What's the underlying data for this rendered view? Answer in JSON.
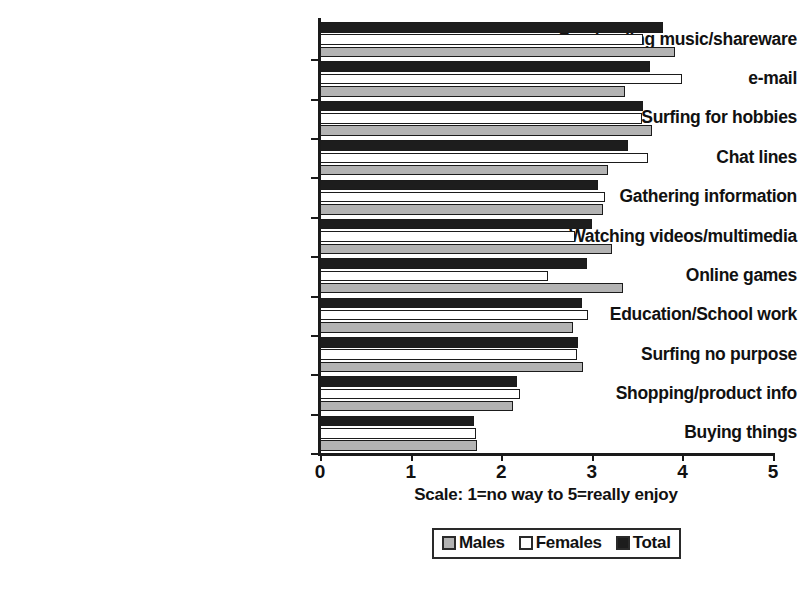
{
  "chart_data": {
    "type": "bar",
    "orientation": "horizontal",
    "title": "",
    "xlabel": "Scale:  1=no way to 5=really enjoy",
    "ylabel": "",
    "xlim": [
      0,
      5
    ],
    "xticks": [
      "0",
      "1",
      "2",
      "3",
      "4",
      "5"
    ],
    "grid": false,
    "legend_position": "bottom-center",
    "categories": [
      "Dowloading music/shareware",
      "e-mail",
      "Surfing for hobbies",
      "Chat lines",
      "Gathering information",
      "Watching videos/multimedia",
      "Online games",
      "Education/School work",
      "Surfing no purpose",
      "Shopping/product info",
      "Buying things"
    ],
    "series": [
      {
        "name": "Total",
        "color": "#1d1d1d",
        "values": [
          3.79,
          3.64,
          3.57,
          3.4,
          3.07,
          3.0,
          2.95,
          2.89,
          2.85,
          2.17,
          1.7
        ]
      },
      {
        "name": "Females",
        "color": "#ffffff",
        "values": [
          3.57,
          4.0,
          3.55,
          3.62,
          3.15,
          2.81,
          2.52,
          2.96,
          2.84,
          2.21,
          1.72
        ]
      },
      {
        "name": "Males",
        "color": "#b3b3b3",
        "values": [
          3.92,
          3.37,
          3.66,
          3.18,
          3.12,
          3.22,
          3.34,
          2.79,
          2.9,
          2.13,
          1.73
        ]
      }
    ],
    "legend": [
      {
        "label": "Males",
        "swatch": "males"
      },
      {
        "label": "Females",
        "swatch": "females"
      },
      {
        "label": "Total",
        "swatch": "total"
      }
    ]
  }
}
